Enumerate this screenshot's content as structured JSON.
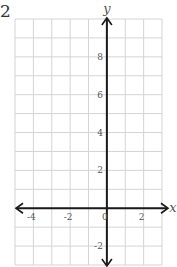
{
  "question_number": "2",
  "graph": {
    "x_axis_label": "x",
    "y_axis_label": "y",
    "x_range": [
      -5,
      3
    ],
    "y_range": [
      -3,
      10
    ],
    "grid_step": 1,
    "x_tick_labels": [
      {
        "value": -4,
        "label": "-4"
      },
      {
        "value": -2,
        "label": "-2"
      },
      {
        "value": 0,
        "label": "0"
      },
      {
        "value": 2,
        "label": "2"
      }
    ],
    "y_tick_labels": [
      {
        "value": 8,
        "label": "8"
      },
      {
        "value": 6,
        "label": "6"
      },
      {
        "value": 4,
        "label": "4"
      },
      {
        "value": 2,
        "label": "2"
      },
      {
        "value": -2,
        "label": "-2"
      }
    ],
    "colors": {
      "grid": "#d4d4d4",
      "axis": "#1a1a1a",
      "label": "#555555"
    }
  }
}
